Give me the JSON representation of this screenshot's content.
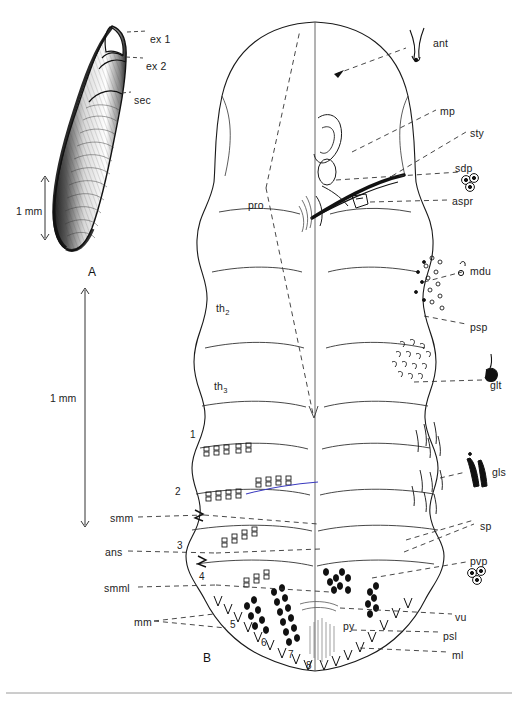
{
  "figure": {
    "background": "#ffffff",
    "ink": "#1a1a1a",
    "accent_blue": "#3b3bbf",
    "rule_color": "#9a9a9a"
  },
  "panels": [
    {
      "id": "A",
      "label": "A",
      "x": 88,
      "y": 265,
      "caption": "egg / exuvial case, lateral view"
    },
    {
      "id": "B",
      "label": "B",
      "x": 203,
      "y": 651,
      "caption": "body, dorsal (left) and ventral (right) halves"
    }
  ],
  "scalebars": [
    {
      "id": "scale-a",
      "label": "1 mm",
      "text_x": 16,
      "text_y": 205,
      "bar_x": 45,
      "bar_y1": 178,
      "bar_y2": 238
    },
    {
      "id": "scale-b",
      "label": "1 mm",
      "text_x": 50,
      "text_y": 392,
      "bar_x": 85,
      "bar_y1": 290,
      "bar_y2": 525
    }
  ],
  "leader_labels": {
    "panel_a": [
      {
        "key": "ex1",
        "text": "ex 1",
        "x": 150,
        "y": 34,
        "side": "right"
      },
      {
        "key": "ex2",
        "text": "ex 2",
        "x": 146,
        "y": 61,
        "side": "right"
      },
      {
        "key": "sec",
        "text": "sec",
        "x": 134,
        "y": 95,
        "side": "right"
      }
    ],
    "panel_b_left": [
      {
        "key": "smm",
        "text": "smm",
        "x": 110,
        "y": 513,
        "side": "left"
      },
      {
        "key": "ans",
        "text": "ans",
        "x": 105,
        "y": 547,
        "side": "left"
      },
      {
        "key": "smml",
        "text": "smml",
        "x": 104,
        "y": 583,
        "side": "left"
      },
      {
        "key": "mm",
        "text": "mm",
        "x": 134,
        "y": 617,
        "side": "left"
      }
    ],
    "panel_b_right": [
      {
        "key": "ant",
        "text": "ant",
        "x": 433,
        "y": 38,
        "side": "right"
      },
      {
        "key": "mp",
        "text": "mp",
        "x": 440,
        "y": 106,
        "side": "right"
      },
      {
        "key": "sty",
        "text": "sty",
        "x": 470,
        "y": 128,
        "side": "right"
      },
      {
        "key": "sdp",
        "text": "sdp",
        "x": 455,
        "y": 163,
        "side": "right"
      },
      {
        "key": "aspr",
        "text": "aspr",
        "x": 452,
        "y": 196,
        "side": "right"
      },
      {
        "key": "mdu",
        "text": "mdu",
        "x": 470,
        "y": 266,
        "side": "right"
      },
      {
        "key": "psp",
        "text": "psp",
        "x": 470,
        "y": 322,
        "side": "right"
      },
      {
        "key": "glt",
        "text": "glt",
        "x": 490,
        "y": 380,
        "side": "right"
      },
      {
        "key": "gls",
        "text": "gls",
        "x": 492,
        "y": 467,
        "side": "right"
      },
      {
        "key": "sp",
        "text": "sp",
        "x": 480,
        "y": 521,
        "side": "right"
      },
      {
        "key": "pvp",
        "text": "pvp",
        "x": 470,
        "y": 556,
        "side": "right"
      },
      {
        "key": "vu",
        "text": "vu",
        "x": 455,
        "y": 612,
        "side": "right"
      },
      {
        "key": "psl",
        "text": "psl",
        "x": 443,
        "y": 631,
        "side": "right"
      },
      {
        "key": "ml",
        "text": "ml",
        "x": 452,
        "y": 650,
        "side": "right"
      }
    ]
  },
  "body_labels": [
    {
      "key": "pro",
      "text": "pro",
      "x": 248,
      "y": 200
    },
    {
      "key": "th2",
      "text": "th",
      "subscript": "2",
      "x": 216,
      "y": 303
    },
    {
      "key": "th3",
      "text": "th",
      "subscript": "3",
      "x": 214,
      "y": 381
    },
    {
      "key": "py",
      "text": "py",
      "x": 343,
      "y": 621
    }
  ],
  "segment_numbers": [
    {
      "n": "1",
      "x": 190,
      "y": 430
    },
    {
      "n": "2",
      "x": 175,
      "y": 487
    },
    {
      "n": "3",
      "x": 177,
      "y": 541
    },
    {
      "n": "4",
      "x": 199,
      "y": 572
    },
    {
      "n": "5",
      "x": 230,
      "y": 620
    },
    {
      "n": "6",
      "x": 261,
      "y": 638
    },
    {
      "n": "7",
      "x": 288,
      "y": 650
    },
    {
      "n": "8",
      "x": 306,
      "y": 661
    }
  ],
  "abbreviation_glossary": [
    {
      "abbr": "ex 1",
      "meaning": "exuvia 1"
    },
    {
      "abbr": "ex 2",
      "meaning": "exuvia 2"
    },
    {
      "abbr": "sec",
      "meaning": "secretion"
    },
    {
      "abbr": "ant",
      "meaning": "antenna"
    },
    {
      "abbr": "mp",
      "meaning": "mouthparts"
    },
    {
      "abbr": "sty",
      "meaning": "stylets"
    },
    {
      "abbr": "sdp",
      "meaning": "sessile disc pore"
    },
    {
      "abbr": "aspr",
      "meaning": "anterior spiracle"
    },
    {
      "abbr": "mdu",
      "meaning": "microduct"
    },
    {
      "abbr": "psp",
      "meaning": "posterior spiracle"
    },
    {
      "abbr": "glt",
      "meaning": "gland tubercle"
    },
    {
      "abbr": "gls",
      "meaning": "gland spine"
    },
    {
      "abbr": "sp",
      "meaning": "spine"
    },
    {
      "abbr": "pvp",
      "meaning": "perivulvar pore"
    },
    {
      "abbr": "vu",
      "meaning": "vulva"
    },
    {
      "abbr": "psl",
      "meaning": "posterior seta"
    },
    {
      "abbr": "ml",
      "meaning": "medial lobe"
    },
    {
      "abbr": "smm",
      "meaning": "submarginal macroduct"
    },
    {
      "abbr": "ans",
      "meaning": "anus"
    },
    {
      "abbr": "smml",
      "meaning": "submarginal macroduct line"
    },
    {
      "abbr": "mm",
      "meaning": "marginal macroduct"
    },
    {
      "abbr": "pro",
      "meaning": "prothorax"
    },
    {
      "abbr": "th",
      "meaning": "thorax segment"
    },
    {
      "abbr": "py",
      "meaning": "pygidium"
    }
  ],
  "footer": {
    "rule": true,
    "rule_y": 693
  }
}
